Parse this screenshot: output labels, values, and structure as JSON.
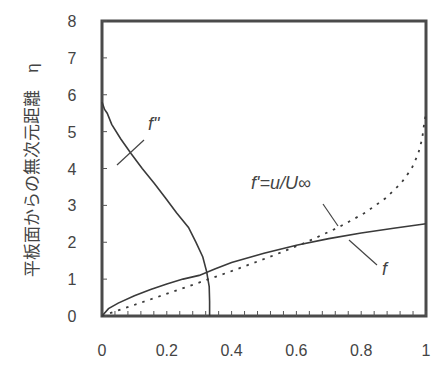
{
  "chart_data": {
    "type": "line",
    "title": "",
    "xlabel": "",
    "ylabel": "平板面からの無次元距離　η",
    "xlim": [
      0,
      1
    ],
    "ylim": [
      0,
      8
    ],
    "grid": false,
    "legend": "none (curves labeled by annotations)",
    "x_ticks": [
      "0",
      "0.2",
      "0.4",
      "0.6",
      "0.8",
      "1"
    ],
    "y_ticks": [
      "0",
      "1",
      "2",
      "3",
      "4",
      "5",
      "6",
      "7",
      "8"
    ],
    "annotations": [
      {
        "text": "f\"",
        "series": "f''"
      },
      {
        "text": "f'=u/U∞",
        "series": "f'"
      },
      {
        "text": "f",
        "series": "f"
      }
    ],
    "series": [
      {
        "name": "f''",
        "style": "solid",
        "points": [
          [
            0.332,
            0.0
          ],
          [
            0.332,
            0.4
          ],
          [
            0.331,
            0.8
          ],
          [
            0.327,
            1.0
          ],
          [
            0.323,
            1.2
          ],
          [
            0.311,
            1.6
          ],
          [
            0.29,
            2.0
          ],
          [
            0.267,
            2.4
          ],
          [
            0.23,
            2.8
          ],
          [
            0.196,
            3.2
          ],
          [
            0.161,
            3.6
          ],
          [
            0.124,
            4.0
          ],
          [
            0.09,
            4.4
          ],
          [
            0.058,
            4.8
          ],
          [
            0.03,
            5.2
          ],
          [
            0.016,
            5.5
          ],
          [
            0.008,
            5.6
          ],
          [
            0.0,
            5.8
          ]
        ]
      },
      {
        "name": "f'",
        "style": "dotted",
        "points": [
          [
            0.0,
            0.0
          ],
          [
            0.066,
            0.2
          ],
          [
            0.133,
            0.4
          ],
          [
            0.265,
            0.8
          ],
          [
            0.33,
            1.0
          ],
          [
            0.394,
            1.2
          ],
          [
            0.517,
            1.6
          ],
          [
            0.63,
            2.0
          ],
          [
            0.729,
            2.4
          ],
          [
            0.812,
            2.8
          ],
          [
            0.876,
            3.2
          ],
          [
            0.923,
            3.6
          ],
          [
            0.956,
            4.0
          ],
          [
            0.976,
            4.4
          ],
          [
            0.988,
            4.8
          ],
          [
            0.994,
            5.2
          ],
          [
            1.0,
            5.5
          ]
        ]
      },
      {
        "name": "f",
        "style": "solid",
        "points": [
          [
            0.0,
            0.0
          ],
          [
            0.02,
            0.2
          ],
          [
            0.05,
            0.35
          ],
          [
            0.1,
            0.55
          ],
          [
            0.15,
            0.72
          ],
          [
            0.2,
            0.87
          ],
          [
            0.25,
            1.0
          ],
          [
            0.3,
            1.1
          ],
          [
            0.35,
            1.28
          ],
          [
            0.4,
            1.45
          ],
          [
            0.5,
            1.7
          ],
          [
            0.6,
            1.92
          ],
          [
            0.7,
            2.1
          ],
          [
            0.8,
            2.25
          ],
          [
            0.9,
            2.38
          ],
          [
            1.0,
            2.5
          ]
        ]
      }
    ]
  }
}
